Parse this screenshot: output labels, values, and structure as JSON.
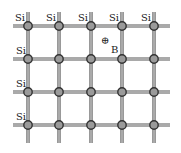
{
  "diagram": {
    "title": "",
    "columns_x": [
      28,
      59,
      91,
      122,
      154
    ],
    "rows_y": [
      26,
      59,
      92,
      125
    ],
    "atom_label": "Si",
    "top_labels": [
      "Si",
      "Si",
      "Si",
      "Si",
      "Si"
    ],
    "left_labels": [
      "Si",
      "Si",
      "Si",
      "Si"
    ],
    "dopant": {
      "symbol": "B",
      "charge_symbol": "⊕",
      "charge_x": 105,
      "charge_y": 44,
      "label_x": 111,
      "label_y": 53
    },
    "colors": {
      "bond": "#555555",
      "bond_inner": "#ffffff",
      "atom_fill": "#9a9a9a",
      "atom_stroke": "#333333",
      "text": "#222222"
    }
  }
}
